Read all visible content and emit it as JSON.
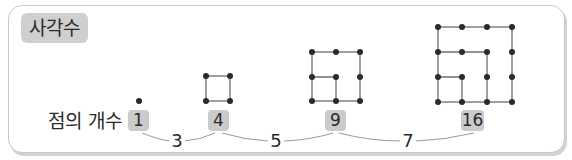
{
  "title": "사각수",
  "row_label": "점의 개수",
  "counts": [
    {
      "value": "1",
      "left": 128,
      "width": 21
    },
    {
      "value": "4",
      "left": 208,
      "width": 21
    },
    {
      "value": "9",
      "left": 325,
      "width": 21
    },
    {
      "value": "16",
      "left": 461,
      "width": 23
    }
  ],
  "differences": [
    {
      "value": "3",
      "left": 169
    },
    {
      "value": "5",
      "left": 267
    },
    {
      "value": "7",
      "left": 400
    }
  ],
  "figures": [
    {
      "n": 1,
      "dots": 1
    },
    {
      "n": 2,
      "dots": 4
    },
    {
      "n": 3,
      "dots": 9
    },
    {
      "n": 4,
      "dots": 16
    }
  ],
  "colors": {
    "badge": "#cfcfcf",
    "dot": "#2a2a2a",
    "line": "#7a7a7a",
    "frame": "#c9c9c9"
  }
}
